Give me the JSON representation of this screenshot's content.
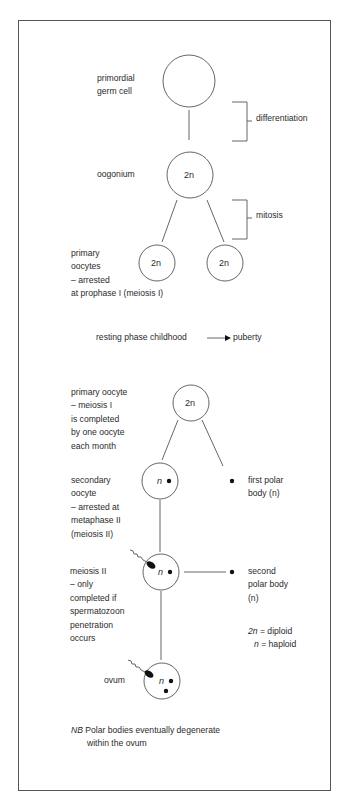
{
  "diagram": {
    "colors": {
      "line": "#555555",
      "text": "#2b2b2b",
      "frame": "#555555",
      "background": "#ffffff"
    },
    "nodes": [
      {
        "id": "primordial-germ-cell",
        "label_lines": [
          "primordial",
          "germ cell"
        ],
        "content": ""
      },
      {
        "id": "oogonium",
        "label_lines": [
          "oogonium"
        ],
        "content": "2n"
      },
      {
        "id": "primary-oocyte-a",
        "label_lines": [
          "primary",
          "oocytes",
          "– arrested",
          "at prophase I (meiosis I)"
        ],
        "content": "2n"
      },
      {
        "id": "primary-oocyte-b",
        "content": "2n"
      },
      {
        "id": "primary-oocyte-resumed",
        "label_lines": [
          "primary oocyte",
          "– meiosis I",
          "is completed",
          "by one oocyte",
          "each month"
        ],
        "content": "2n"
      },
      {
        "id": "secondary-oocyte",
        "label_lines": [
          "secondary",
          "oocyte",
          "– arrested at",
          "metaphase II",
          "(meiosis II)"
        ],
        "content": "n"
      },
      {
        "id": "first-polar-body",
        "label_lines": [
          "first polar",
          "body (n)"
        ]
      },
      {
        "id": "meiosis-ii-cell",
        "label_lines": [
          "meiosis II",
          "– only",
          "completed if",
          "spermatozoon",
          "penetration",
          "occurs"
        ],
        "content": "n"
      },
      {
        "id": "second-polar-body",
        "label_lines": [
          "second",
          "polar body",
          "(n)"
        ]
      },
      {
        "id": "ovum",
        "label_lines": [
          "ovum"
        ],
        "content": "n"
      }
    ],
    "brackets": [
      {
        "id": "differentiation",
        "label": "differentiation"
      },
      {
        "id": "mitosis",
        "label": "mitosis"
      }
    ],
    "phase_note": {
      "left": "resting phase childhood",
      "right": "puberty"
    },
    "legend": [
      {
        "symbol": "2n",
        "text": "= diploid"
      },
      {
        "symbol": "n",
        "text": "= haploid"
      }
    ],
    "footnote": {
      "prefix": "NB",
      "line1": "Polar bodies eventually degenerate",
      "line2": "within the ovum"
    }
  }
}
